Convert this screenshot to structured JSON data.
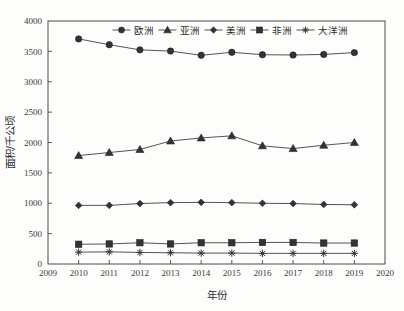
{
  "chart_data": {
    "type": "line",
    "title": "",
    "xlabel": "年份",
    "ylabel": "面积/千公顷",
    "xlim": [
      2009,
      2020
    ],
    "ylim": [
      0,
      4000
    ],
    "xticks": [
      "2009",
      "2010",
      "2011",
      "2012",
      "2013",
      "2014",
      "2015",
      "2016",
      "2017",
      "2018",
      "2019",
      "2020"
    ],
    "yticks": [
      "0",
      "500",
      "1000",
      "1500",
      "2000",
      "2500",
      "3000",
      "3500",
      "4000"
    ],
    "grid": false,
    "legend_position": "top-center",
    "x": [
      2010,
      2011,
      2012,
      2013,
      2014,
      2015,
      2016,
      2017,
      2018,
      2019
    ],
    "categories": [
      "2010",
      "2011",
      "2012",
      "2013",
      "2014",
      "2015",
      "2016",
      "2017",
      "2018",
      "2019"
    ],
    "series": [
      {
        "name": "欧洲",
        "marker": "circle",
        "color": "#333333",
        "values": [
          3705,
          3610,
          3525,
          3505,
          3435,
          3485,
          3445,
          3440,
          3450,
          3480
        ]
      },
      {
        "name": "亚洲",
        "marker": "triangle",
        "color": "#333333",
        "values": [
          1785,
          1835,
          1885,
          2025,
          2075,
          2110,
          1945,
          1900,
          1955,
          2000
        ]
      },
      {
        "name": "美洲",
        "marker": "diamond",
        "color": "#333333",
        "values": [
          965,
          965,
          995,
          1010,
          1015,
          1010,
          1000,
          995,
          980,
          975
        ]
      },
      {
        "name": "非洲",
        "marker": "square",
        "color": "#333333",
        "values": [
          325,
          330,
          350,
          330,
          350,
          350,
          355,
          355,
          345,
          345
        ]
      },
      {
        "name": "大洋洲",
        "marker": "asterisk",
        "color": "#333333",
        "values": [
          195,
          200,
          190,
          185,
          180,
          180,
          175,
          175,
          175,
          175
        ]
      }
    ]
  },
  "legend": {
    "items": [
      {
        "label": "欧洲",
        "marker": "circle"
      },
      {
        "label": "亚洲",
        "marker": "triangle"
      },
      {
        "label": "美洲",
        "marker": "diamond"
      },
      {
        "label": "非洲",
        "marker": "square"
      },
      {
        "label": "大洋洲",
        "marker": "asterisk"
      }
    ]
  },
  "axes": {
    "x_title": "年份",
    "y_title": "面积/千公顷"
  }
}
